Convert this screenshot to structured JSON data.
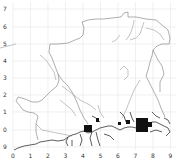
{
  "map": {
    "type": "grid-map",
    "colors": {
      "background": "#ffffff",
      "grid": "#e6e6e6",
      "boundary": "#8c8c8c",
      "river": "#9a9a9a",
      "coast": "#333333",
      "urban": "#111111"
    },
    "x_axis": {
      "ticks": [
        "0",
        "1",
        "2",
        "3",
        "4",
        "5",
        "6",
        "7",
        "8",
        "9"
      ],
      "positions": [
        13,
        30.5,
        48,
        65.5,
        83,
        100.5,
        118,
        135.5,
        153,
        170.5
      ]
    },
    "y_axis": {
      "ticks": [
        "7",
        "6",
        "5",
        "4",
        "3",
        "2",
        "1",
        "0",
        "9"
      ],
      "positions": [
        9,
        27,
        44,
        61,
        78,
        95,
        112,
        130,
        147
      ]
    },
    "features": [
      {
        "name": "region-boundary",
        "kind": "boundary"
      },
      {
        "name": "rivers",
        "kind": "river"
      },
      {
        "name": "southern-coastline",
        "kind": "coast"
      },
      {
        "name": "urban-area-west",
        "kind": "urban"
      },
      {
        "name": "urban-area-east",
        "kind": "urban"
      }
    ]
  }
}
